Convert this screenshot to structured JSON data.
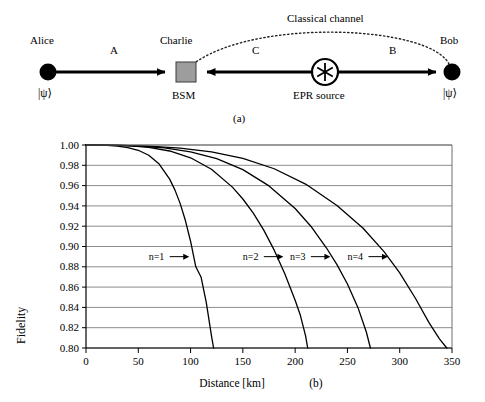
{
  "figure": {
    "panel_a": {
      "caption": "(a)",
      "nodes": [
        {
          "name": "alice",
          "label": "Alice",
          "sublabel": "|ψ⟩",
          "x": 48,
          "y": 72
        },
        {
          "name": "charlie",
          "label": "Charlie",
          "sublabel": "BSM",
          "x": 183,
          "y": 72
        },
        {
          "name": "epr",
          "label": "EPR source",
          "sublabel": "",
          "x": 325,
          "y": 72
        },
        {
          "name": "bob",
          "label": "Bob",
          "sublabel": "|ψ⟩",
          "x": 452,
          "y": 72
        }
      ],
      "link_labels": [
        {
          "name": "link-a",
          "label": "A",
          "x": 113,
          "y": 52
        },
        {
          "name": "link-c",
          "label": "C",
          "x": 255,
          "y": 52
        },
        {
          "name": "link-b",
          "label": "B",
          "x": 392,
          "y": 52
        }
      ],
      "classical_channel_label": "Classical channel"
    },
    "panel_b": {
      "caption": "(b)",
      "chart_data": {
        "type": "line",
        "title": "",
        "xlabel": "Distance [km]",
        "ylabel": "Fidelity",
        "xlim": [
          0,
          350
        ],
        "ylim": [
          0.8,
          1.0
        ],
        "xticks": [
          0,
          50,
          100,
          150,
          200,
          250,
          300,
          350
        ],
        "yticks": [
          0.8,
          0.82,
          0.84,
          0.86,
          0.88,
          0.9,
          0.92,
          0.94,
          0.96,
          0.98,
          1.0
        ],
        "xtick_labels": [
          "0",
          "50",
          "100",
          "150",
          "200",
          "250",
          "300",
          "350"
        ],
        "ytick_labels": [
          "0.80",
          "0.82",
          "0.84",
          "0.86",
          "0.88",
          "0.90",
          "0.92",
          "0.94",
          "0.96",
          "0.98",
          "1.00"
        ],
        "grid": true,
        "grid_axis": "y",
        "legend": "inline-annotations",
        "series": [
          {
            "name": "n=1",
            "label": "n=1",
            "annotation_x": 60,
            "annotation_y": 0.89,
            "x": [
              0,
              10,
              20,
              30,
              40,
              50,
              60,
              70,
              80,
              85,
              90,
              95,
              100,
              105,
              110,
              115,
              120,
              122
            ],
            "values": [
              1.0,
              0.9999,
              0.9996,
              0.9989,
              0.9975,
              0.9948,
              0.9899,
              0.9812,
              0.9664,
              0.9558,
              0.9425,
              0.9258,
              0.9052,
              0.88,
              0.87,
              0.845,
              0.812,
              0.8
            ]
          },
          {
            "name": "n=2",
            "label": "n=2",
            "annotation_x": 150,
            "annotation_y": 0.89,
            "x": [
              0,
              20,
              40,
              60,
              80,
              100,
              120,
              140,
              150,
              160,
              170,
              180,
              190,
              200,
              205,
              210,
              212
            ],
            "values": [
              1.0,
              0.9999,
              0.9993,
              0.9977,
              0.9941,
              0.9874,
              0.9761,
              0.9585,
              0.9468,
              0.9328,
              0.9161,
              0.8964,
              0.8735,
              0.847,
              0.8322,
              0.812,
              0.8
            ]
          },
          {
            "name": "n=3",
            "label": "n=3",
            "annotation_x": 195,
            "annotation_y": 0.89,
            "x": [
              0,
              25,
              50,
              75,
              100,
              125,
              150,
              175,
              200,
              215,
              230,
              240,
              250,
              260,
              268,
              272
            ],
            "values": [
              1.0,
              0.9998,
              0.999,
              0.9971,
              0.9932,
              0.9865,
              0.9757,
              0.9597,
              0.9374,
              0.92,
              0.8985,
              0.8822,
              0.863,
              0.84,
              0.816,
              0.8
            ]
          },
          {
            "name": "n=4",
            "label": "n=4",
            "annotation_x": 250,
            "annotation_y": 0.89,
            "x": [
              0,
              30,
              60,
              90,
              120,
              150,
              180,
              210,
              240,
              265,
              285,
              300,
              315,
              328,
              338,
              345
            ],
            "values": [
              1.0,
              0.9997,
              0.9989,
              0.997,
              0.9932,
              0.9868,
              0.9766,
              0.9615,
              0.9404,
              0.918,
              0.895,
              0.874,
              0.849,
              0.825,
              0.809,
              0.8
            ]
          }
        ]
      }
    }
  }
}
